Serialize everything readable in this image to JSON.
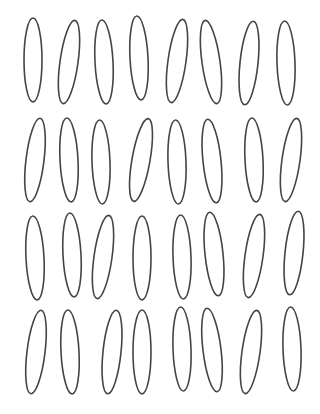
{
  "figure": {
    "stroke_color": "#444444",
    "background": "#ffffff",
    "rows": 4,
    "cols": 8,
    "rx": 9,
    "ry": 42,
    "ellipses": [
      {
        "cx": 33,
        "cy": 60,
        "rot": 0
      },
      {
        "cx": 69,
        "cy": 62,
        "rot": 8
      },
      {
        "cx": 104,
        "cy": 62,
        "rot": -3
      },
      {
        "cx": 139,
        "cy": 58,
        "rot": -3
      },
      {
        "cx": 177,
        "cy": 61,
        "rot": 8
      },
      {
        "cx": 211,
        "cy": 62,
        "rot": -8
      },
      {
        "cx": 249,
        "cy": 63,
        "rot": 6
      },
      {
        "cx": 286,
        "cy": 63,
        "rot": -2
      },
      {
        "cx": 35,
        "cy": 160,
        "rot": 7
      },
      {
        "cx": 69,
        "cy": 160,
        "rot": -3
      },
      {
        "cx": 101,
        "cy": 162,
        "rot": -2
      },
      {
        "cx": 141,
        "cy": 160,
        "rot": 10
      },
      {
        "cx": 177,
        "cy": 162,
        "rot": -2
      },
      {
        "cx": 212,
        "cy": 161,
        "rot": -6
      },
      {
        "cx": 254,
        "cy": 160,
        "rot": -3
      },
      {
        "cx": 291,
        "cy": 160,
        "rot": 8
      },
      {
        "cx": 35,
        "cy": 258,
        "rot": -3
      },
      {
        "cx": 72,
        "cy": 255,
        "rot": -3
      },
      {
        "cx": 103,
        "cy": 257,
        "rot": 8
      },
      {
        "cx": 142,
        "cy": 258,
        "rot": 0
      },
      {
        "cx": 182,
        "cy": 257,
        "rot": -2
      },
      {
        "cx": 214,
        "cy": 254,
        "rot": -6
      },
      {
        "cx": 254,
        "cy": 256,
        "rot": 8
      },
      {
        "cx": 294,
        "cy": 253,
        "rot": 6
      },
      {
        "cx": 36,
        "cy": 352,
        "rot": 7
      },
      {
        "cx": 70,
        "cy": 352,
        "rot": -3
      },
      {
        "cx": 112,
        "cy": 352,
        "rot": 6
      },
      {
        "cx": 142,
        "cy": 352,
        "rot": 0
      },
      {
        "cx": 182,
        "cy": 349,
        "rot": -2
      },
      {
        "cx": 212,
        "cy": 350,
        "rot": -7
      },
      {
        "cx": 251,
        "cy": 352,
        "rot": 8
      },
      {
        "cx": 292,
        "cy": 349,
        "rot": -2
      }
    ]
  }
}
